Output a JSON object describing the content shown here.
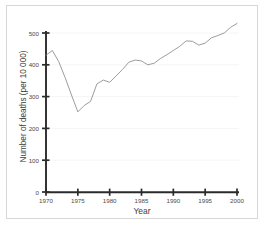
{
  "chart_data": {
    "type": "line",
    "title": "",
    "subtitle": "",
    "xlabel": "Year",
    "ylabel": "Number of deaths (per 10 000)",
    "xlim": [
      1970,
      2000
    ],
    "ylim": [
      0,
      530
    ],
    "xticks": [
      1970,
      1975,
      1980,
      1985,
      1990,
      1995,
      2000
    ],
    "xtick_labels": [
      "1970",
      "1975",
      "1980",
      "1985",
      "1990",
      "1995",
      "2000"
    ],
    "yticks": [
      0,
      100,
      200,
      300,
      400,
      500
    ],
    "ytick_labels": [
      "0",
      "100",
      "200",
      "300",
      "400",
      "500"
    ],
    "grid": "horizontal-only-faint",
    "legend": "none",
    "legend_position": "",
    "annotations": [],
    "line_color": "#8a8a8a",
    "axis_color": "#2b2b2b",
    "grid_color": "#f2f2f2",
    "frame_color": "#d7d7d7",
    "x": [
      1970,
      1971,
      1972,
      1973,
      1974,
      1975,
      1976,
      1977,
      1978,
      1979,
      1980,
      1981,
      1982,
      1983,
      1984,
      1985,
      1986,
      1987,
      1988,
      1989,
      1990,
      1991,
      1992,
      1993,
      1994,
      1995,
      1996,
      1997,
      1998,
      1999,
      2000
    ],
    "series": [
      {
        "name": "Number of deaths (per 10 000)",
        "values": [
          430,
          445,
          410,
          360,
          305,
          252,
          272,
          285,
          340,
          352,
          345,
          365,
          385,
          408,
          415,
          412,
          400,
          405,
          420,
          432,
          445,
          458,
          475,
          474,
          462,
          468,
          485,
          492,
          500,
          518,
          530
        ]
      }
    ]
  },
  "axes": {
    "x_title": "Year",
    "y_title": "Number of deaths (per 10 000)"
  }
}
